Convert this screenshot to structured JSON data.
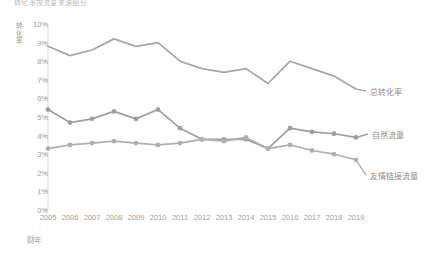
{
  "chart_data": {
    "type": "line",
    "title": "转化率按流量来源细分",
    "xlabel": "财年",
    "ylabel": "转化率",
    "grid": true,
    "legend_position": "right-inline",
    "x": [
      2005,
      2006,
      2007,
      2008,
      2009,
      2010,
      2011,
      2012,
      2013,
      2014,
      2015,
      2016,
      2017,
      2018,
      2019
    ],
    "categories": [
      "2005",
      "2006",
      "2007",
      "2008",
      "2009",
      "2010",
      "2011",
      "2012",
      "2013",
      "2014",
      "2015",
      "2016",
      "2017",
      "2018",
      "2019"
    ],
    "ylim": [
      0,
      10
    ],
    "ytick_labels": [
      "0%",
      "1%",
      "2%",
      "3%",
      "4%",
      "5%",
      "6%",
      "7%",
      "8%",
      "9%",
      "10%"
    ],
    "ytick_values": [
      0,
      1,
      2,
      3,
      4,
      5,
      6,
      7,
      8,
      9,
      10
    ],
    "series": [
      {
        "name": "总转化率",
        "color": "#a6a6a6",
        "markers": false,
        "values": [
          8.8,
          8.3,
          8.6,
          9.2,
          8.8,
          9.0,
          8.0,
          7.6,
          7.4,
          7.6,
          6.8,
          8.0,
          7.6,
          7.2,
          6.5
        ]
      },
      {
        "name": "自然流量",
        "color": "#9e9e9e",
        "markers": true,
        "values": [
          5.4,
          4.7,
          4.9,
          5.3,
          4.9,
          5.4,
          4.4,
          3.8,
          3.8,
          3.8,
          3.3,
          4.4,
          4.2,
          4.1,
          3.9
        ]
      },
      {
        "name": "友情链接流量",
        "color": "#b0b0b0",
        "markers": true,
        "values": [
          3.3,
          3.5,
          3.6,
          3.7,
          3.6,
          3.5,
          3.6,
          3.8,
          3.7,
          3.9,
          3.3,
          3.5,
          3.2,
          3.0,
          2.7
        ]
      }
    ]
  },
  "axis": {
    "axis_line_color": "#d9d9d9",
    "grid_color": "#e3e3e3"
  },
  "series_labels": [
    {
      "text": "总转化率",
      "x": 370,
      "y": 86
    },
    {
      "text": "自然流量",
      "x": 372,
      "y": 129
    },
    {
      "text": "友情链接流量",
      "x": 370,
      "y": 170
    }
  ]
}
